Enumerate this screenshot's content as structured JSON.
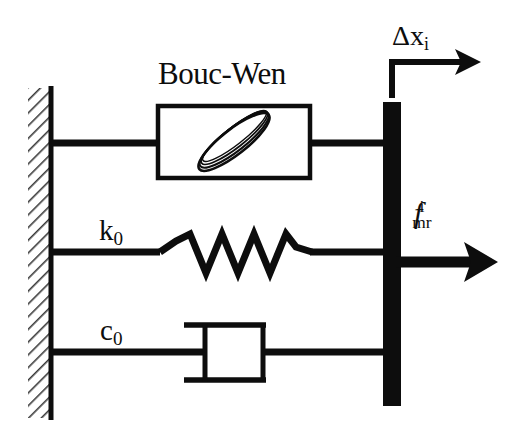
{
  "diagram": {
    "type": "mechanical-schematic",
    "background_color": "#ffffff",
    "stroke_color": "#0d0d0d",
    "branches": [
      {
        "name": "bouc-wen-element",
        "label": "Bouc-Wen",
        "element": "hysteresis-box",
        "row_y": 143
      },
      {
        "name": "spring-element",
        "label": "k",
        "label_subscript": "0",
        "element": "coil-spring",
        "row_y": 252
      },
      {
        "name": "damper-element",
        "label": "c",
        "label_subscript": "0",
        "element": "dashpot",
        "row_y": 352
      }
    ],
    "labels": {
      "bouc_wen": "Bouc-Wen",
      "spring_stiffness": "k",
      "spring_stiffness_sub": "0",
      "damping_coefficient": "c",
      "damping_coefficient_sub": "0",
      "displacement_symbol": "Δx",
      "displacement_subscript": "i",
      "force_symbol": "f",
      "force_superscript": "i",
      "force_subscript": "mr"
    },
    "fixed_wall": {
      "name": "hatched-wall",
      "x": 28,
      "width": 24,
      "top": 88,
      "bottom": 418,
      "hatch_angle_deg": 45
    },
    "moving_bar": {
      "name": "rigid-moving-bar",
      "x": 383,
      "width": 18,
      "top": 102,
      "bottom": 406,
      "fill": "#0d0d0d"
    },
    "arrows": [
      {
        "name": "displacement-arrow",
        "direction": "right",
        "from_x": 392,
        "to_x": 470,
        "y": 62
      },
      {
        "name": "force-arrow",
        "direction": "right",
        "from_x": 401,
        "to_x": 492,
        "y": 262
      }
    ]
  }
}
